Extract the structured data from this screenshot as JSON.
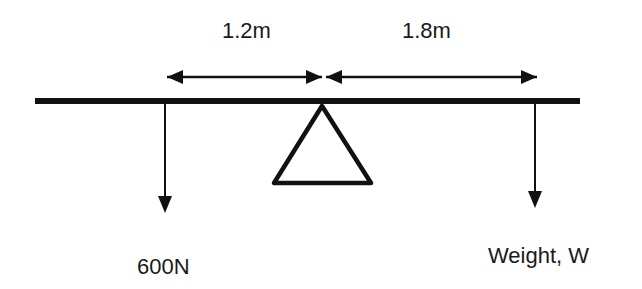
{
  "diagram": {
    "type": "lever-moment-diagram",
    "colors": {
      "stroke": "#111111",
      "background": "#ffffff",
      "text": "#1a1a1a"
    },
    "dimensions": [
      {
        "id": "left-distance",
        "label": "1.2m"
      },
      {
        "id": "right-distance",
        "label": "1.8m"
      }
    ],
    "forces": [
      {
        "id": "left-force",
        "label": "600N",
        "direction": "down"
      },
      {
        "id": "right-force",
        "label": "Weight, W",
        "direction": "down"
      }
    ],
    "beam": {
      "label": "beam"
    },
    "pivot": {
      "label": "fulcrum",
      "shape": "triangle"
    }
  }
}
